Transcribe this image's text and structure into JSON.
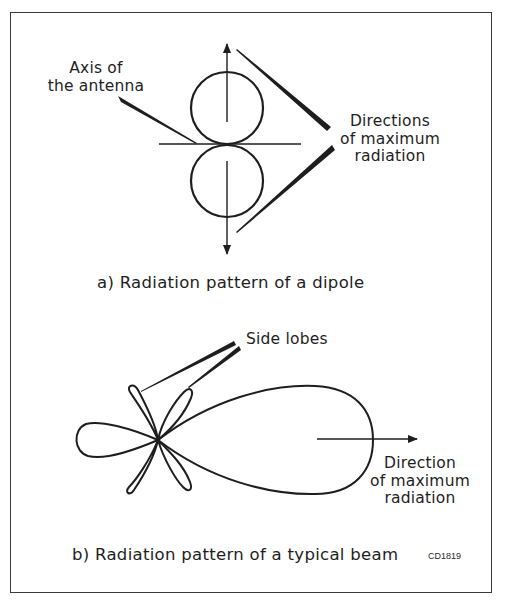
{
  "figure_code": "CD1819",
  "panel_a": {
    "caption": "a) Radiation pattern of a dipole",
    "labels": {
      "axis_line1": "Axis of",
      "axis_line2": "the antenna",
      "directions_line1": "Directions",
      "directions_line2": "of maximum",
      "directions_line3": "radiation"
    }
  },
  "panel_b": {
    "caption": "b) Radiation pattern of a typical beam",
    "labels": {
      "side_lobes": "Side lobes",
      "direction_line1": "Direction",
      "direction_line2": "of maximum",
      "direction_line3": "radiation"
    }
  },
  "colors": {
    "ink": "#1e1e1e",
    "background": "#ffffff",
    "frame": "#3a3a3a"
  }
}
